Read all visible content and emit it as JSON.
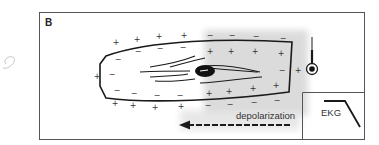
{
  "panel": {
    "label": "B"
  },
  "cell": {
    "outer_signs_left_region": [
      "+",
      "+",
      "+",
      "+",
      "+",
      "+",
      "+",
      "+",
      "+"
    ],
    "inner_signs_left_region": [
      "−",
      "−",
      "−",
      "−",
      "−",
      "−",
      "−",
      "−",
      "−"
    ],
    "outer_signs_depolarized_region": [
      "−",
      "−",
      "−",
      "−",
      "−",
      "−",
      "−",
      "−"
    ],
    "inner_signs_depolarized_region": [
      "+",
      "+",
      "+",
      "+",
      "+",
      "+",
      "+",
      "+"
    ],
    "right_outer_sign": "+",
    "right_inner_sign": "−"
  },
  "electrode": {
    "icon": "recording-electrode-icon"
  },
  "arrow": {
    "label": "depolarization",
    "direction": "left"
  },
  "ekg_inset": {
    "label": "EKG",
    "trace": "downward-deflection"
  },
  "colors": {
    "line": "#1a1a1a",
    "shade": "#d6d6d6",
    "border": "#555555",
    "pencil": "#c8c8c8"
  }
}
